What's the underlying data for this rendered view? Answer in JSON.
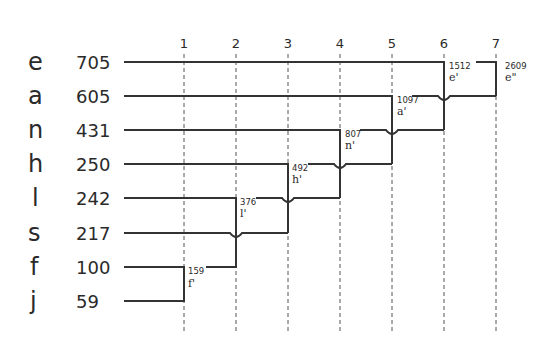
{
  "diagram": {
    "type": "huffman-merge-ladder",
    "columns": [
      "1",
      "2",
      "3",
      "4",
      "5",
      "6",
      "7"
    ],
    "symbols": [
      {
        "letter": "e",
        "weight": "705"
      },
      {
        "letter": "a",
        "weight": "605"
      },
      {
        "letter": "n",
        "weight": "431"
      },
      {
        "letter": "h",
        "weight": "250"
      },
      {
        "letter": "l",
        "weight": "242"
      },
      {
        "letter": "s",
        "weight": "217"
      },
      {
        "letter": "f",
        "weight": "100"
      },
      {
        "letter": "j",
        "weight": "59"
      }
    ],
    "merges": [
      {
        "step": "1",
        "weight": "159",
        "name": "f'",
        "children": [
          "f",
          "j"
        ]
      },
      {
        "step": "2",
        "weight": "376",
        "name": "l'",
        "children": [
          "l",
          "f'"
        ]
      },
      {
        "step": "3",
        "weight": "492",
        "name": "h'",
        "children": [
          "h",
          "s"
        ]
      },
      {
        "step": "4",
        "weight": "807",
        "name": "n'",
        "children": [
          "n",
          "l'"
        ]
      },
      {
        "step": "5",
        "weight": "1097",
        "name": "a'",
        "children": [
          "a",
          "h'"
        ]
      },
      {
        "step": "6",
        "weight": "1512",
        "name": "e'",
        "children": [
          "e",
          "n'"
        ]
      },
      {
        "step": "7",
        "weight": "2609",
        "name": "e\"",
        "children": [
          "e'",
          "a'"
        ]
      }
    ]
  }
}
